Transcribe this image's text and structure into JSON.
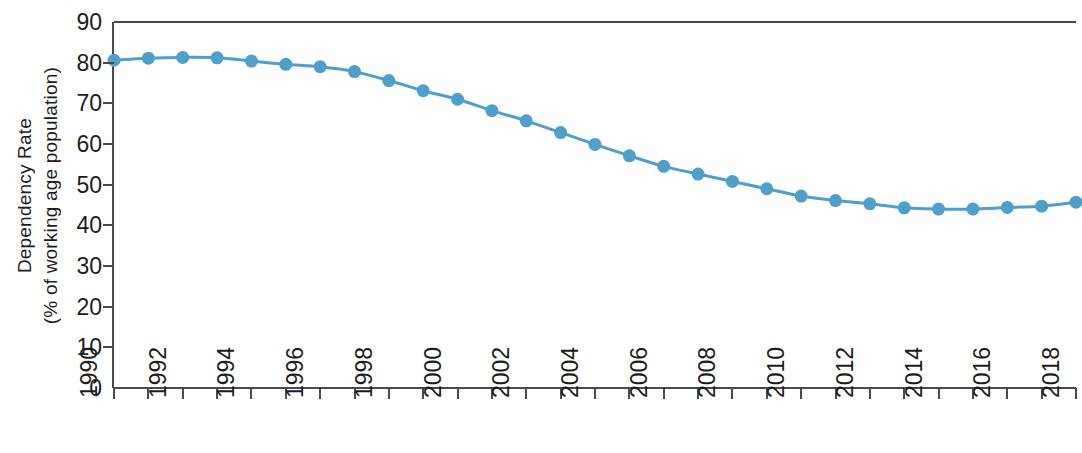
{
  "chart_data": {
    "type": "line",
    "title": "",
    "xlabel": "",
    "ylabel": "Dependency Rate (% of working age population)",
    "ylabel_lines": [
      "Dependency Rate",
      "(% of working age population)"
    ],
    "xlim": [
      1990,
      2018
    ],
    "ylim": [
      0,
      90
    ],
    "y_ticks": [
      0,
      10,
      20,
      30,
      40,
      50,
      60,
      70,
      80,
      90
    ],
    "x_ticks": [
      1990,
      1991,
      1992,
      1993,
      1994,
      1995,
      1996,
      1997,
      1998,
      1999,
      2000,
      2001,
      2002,
      2003,
      2004,
      2005,
      2006,
      2007,
      2008,
      2009,
      2010,
      2011,
      2012,
      2013,
      2014,
      2015,
      2016,
      2017,
      2018
    ],
    "x_tick_labels": [
      "1990",
      "",
      "1992",
      "",
      "1994",
      "",
      "1996",
      "",
      "1998",
      "",
      "2000",
      "",
      "2002",
      "",
      "2004",
      "",
      "2006",
      "",
      "2008",
      "",
      "2010",
      "",
      "2012",
      "",
      "2014",
      "",
      "2016",
      "",
      "2018"
    ],
    "grid": false,
    "legend": false,
    "series_color": "#4f9fca",
    "marker": "circle",
    "marker_size": 13,
    "line_width": 3,
    "x": [
      1990,
      1991,
      1992,
      1993,
      1994,
      1995,
      1996,
      1997,
      1998,
      1999,
      2000,
      2001,
      2002,
      2003,
      2004,
      2005,
      2006,
      2007,
      2008,
      2009,
      2010,
      2011,
      2012,
      2013,
      2014,
      2015,
      2016,
      2017,
      2018
    ],
    "values": [
      80.6,
      81.1,
      81.3,
      81.2,
      80.4,
      79.6,
      79.0,
      77.8,
      75.6,
      73.1,
      71.0,
      68.2,
      65.7,
      62.8,
      59.9,
      57.1,
      54.5,
      52.6,
      50.8,
      49.0,
      47.2,
      46.1,
      45.3,
      44.3,
      44.0,
      44.0,
      44.4,
      44.7,
      45.7
    ],
    "series": [
      {
        "name": "Dependency Rate",
        "values": [
          80.6,
          81.1,
          81.3,
          81.2,
          80.4,
          79.6,
          79.0,
          77.8,
          75.6,
          73.1,
          71.0,
          68.2,
          65.7,
          62.8,
          59.9,
          57.1,
          54.5,
          52.6,
          50.8,
          49.0,
          47.2,
          46.1,
          45.3,
          44.3,
          44.0,
          44.0,
          44.4,
          44.7,
          45.7
        ]
      }
    ]
  },
  "axis_color": "#4a4a4a"
}
